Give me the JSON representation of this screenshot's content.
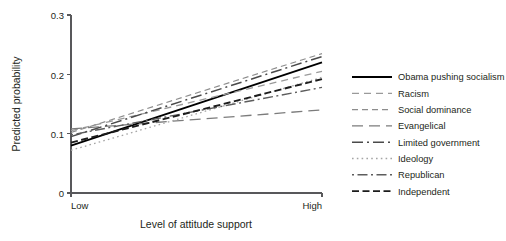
{
  "chart_data": {
    "type": "line",
    "title": "",
    "xlabel": "Level of attitude support",
    "ylabel": "Predicted probability",
    "x": [
      "Low",
      "High"
    ],
    "xtick_labels": [
      "Low",
      "High"
    ],
    "ytick_labels": [
      "0",
      "0.1",
      "0.2",
      "0.3"
    ],
    "ytick_values": [
      0,
      0.1,
      0.2,
      0.3
    ],
    "ylim": [
      0,
      0.3
    ],
    "xlim": [
      0,
      1
    ],
    "grid": false,
    "legend_position": "right",
    "series": [
      {
        "name": "Obama pushing socialism",
        "values": [
          0.08,
          0.22
        ],
        "style": "solid",
        "color": "#000000",
        "width": 1.9,
        "dash": ""
      },
      {
        "name": "Racism",
        "values": [
          0.105,
          0.205
        ],
        "style": "dashed-light",
        "color": "#9a9a9a",
        "width": 1.3,
        "dash": "7 5"
      },
      {
        "name": "Social dominance",
        "values": [
          0.102,
          0.235
        ],
        "style": "dashed",
        "color": "#8d8d8d",
        "width": 1.2,
        "dash": "6 4"
      },
      {
        "name": "Evangelical",
        "values": [
          0.108,
          0.14
        ],
        "style": "long-dash",
        "color": "#7c7c7c",
        "width": 1.3,
        "dash": "11 6"
      },
      {
        "name": "Limited government",
        "values": [
          0.095,
          0.23
        ],
        "style": "dash-dot",
        "color": "#4a4a4a",
        "width": 1.5,
        "dash": "11 4 2 4"
      },
      {
        "name": "Ideology",
        "values": [
          0.072,
          0.195
        ],
        "style": "dotted",
        "color": "#a5a5a5",
        "width": 1.3,
        "dash": "1.6 3.2"
      },
      {
        "name": "Republican",
        "values": [
          0.098,
          0.178
        ],
        "style": "dash-dot-light",
        "color": "#5d5d5d",
        "width": 1.4,
        "dash": "2 3.5 10 3.5"
      },
      {
        "name": "Independent",
        "values": [
          0.085,
          0.192
        ],
        "style": "bold-dashed",
        "color": "#1c1c1c",
        "width": 1.9,
        "dash": "7 3.5"
      }
    ]
  },
  "axes": {
    "y_title": "Predicted probability",
    "x_title": "Level of attitude support",
    "y_ticks": [
      "0.3",
      "0.2",
      "0.1",
      "0"
    ],
    "x_labels": [
      "Low",
      "High"
    ]
  },
  "legend": {
    "items": [
      {
        "label": "Obama pushing socialism"
      },
      {
        "label": "Racism"
      },
      {
        "label": "Social dominance"
      },
      {
        "label": "Evangelical"
      },
      {
        "label": "Limited government"
      },
      {
        "label": "Ideology"
      },
      {
        "label": "Republican"
      },
      {
        "label": "Independent"
      }
    ]
  },
  "colors": {
    "axis": "#58585b",
    "text": "#231f20",
    "background": "#ffffff"
  }
}
